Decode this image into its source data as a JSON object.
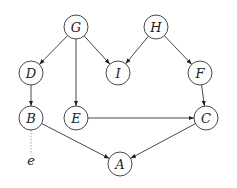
{
  "diagram": {
    "type": "directed-graph",
    "nodes": [
      {
        "id": "G",
        "label": "G",
        "x": 76,
        "y": 27
      },
      {
        "id": "H",
        "label": "H",
        "x": 156,
        "y": 27
      },
      {
        "id": "D",
        "label": "D",
        "x": 31,
        "y": 73
      },
      {
        "id": "I",
        "label": "I",
        "x": 118,
        "y": 73
      },
      {
        "id": "F",
        "label": "F",
        "x": 200,
        "y": 73
      },
      {
        "id": "B",
        "label": "B",
        "x": 31,
        "y": 118
      },
      {
        "id": "E",
        "label": "E",
        "x": 76,
        "y": 118
      },
      {
        "id": "C",
        "label": "C",
        "x": 206,
        "y": 118
      },
      {
        "id": "A",
        "label": "A",
        "x": 120,
        "y": 164
      }
    ],
    "edges": [
      {
        "from": "G",
        "to": "D"
      },
      {
        "from": "G",
        "to": "E"
      },
      {
        "from": "G",
        "to": "I"
      },
      {
        "from": "H",
        "to": "I"
      },
      {
        "from": "H",
        "to": "F"
      },
      {
        "from": "D",
        "to": "B"
      },
      {
        "from": "F",
        "to": "C"
      },
      {
        "from": "E",
        "to": "C"
      },
      {
        "from": "B",
        "to": "A"
      },
      {
        "from": "C",
        "to": "A"
      }
    ],
    "aux": {
      "label": "e",
      "attached_to": "B",
      "x": 31,
      "y": 163,
      "style": "dotted"
    },
    "node_radius": 12,
    "stroke_color": "#333333"
  }
}
